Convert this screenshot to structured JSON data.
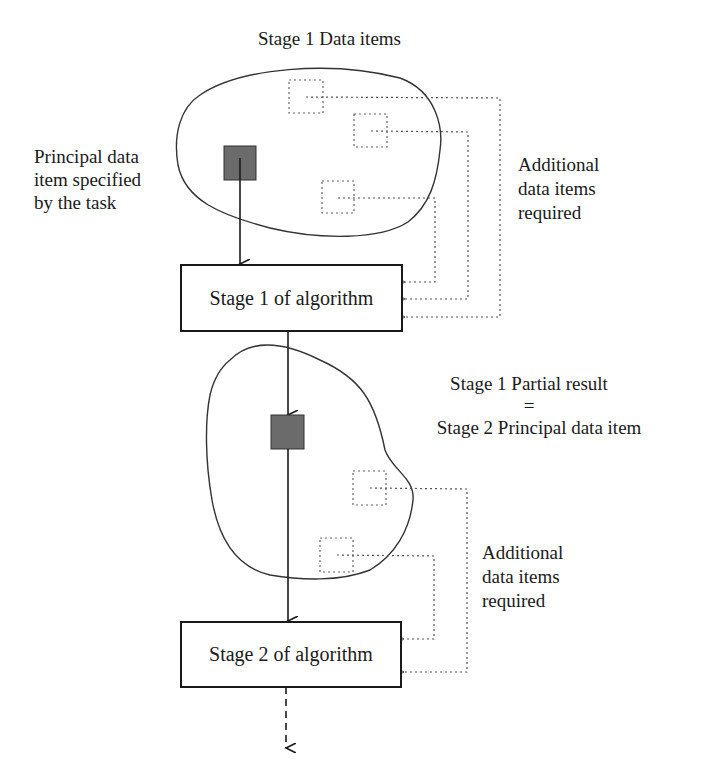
{
  "diagram": {
    "title": "Stage 1 Data items",
    "principal_label": [
      "Principal data",
      "item specified",
      "by the task"
    ],
    "additional_label_1": [
      "Additional",
      "data items",
      "required"
    ],
    "stage1_box": "Stage 1 of algorithm",
    "partial_result": {
      "line1": "Stage 1 Partial result",
      "eq": "=",
      "line2": "Stage 2 Principal data item"
    },
    "additional_label_2": [
      "Additional",
      "data items",
      "required"
    ],
    "stage2_box": "Stage 2 of algorithm",
    "colors": {
      "line": "#1a1a1a",
      "principal_fill": "#6b6b6b",
      "dotted": "#555555",
      "blob": "#333333"
    }
  }
}
